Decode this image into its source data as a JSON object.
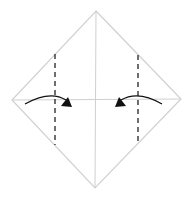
{
  "diagram": {
    "kind": "origami-fold-step",
    "colors": {
      "background": "#ffffff",
      "paper_edge": "#d0d0d0",
      "crease": "#d0d0d0",
      "valley_fold": "#222222",
      "arrow": "#111111"
    },
    "square": {
      "top": [
        96,
        11
      ],
      "right": [
        181,
        99
      ],
      "bottom": [
        95,
        188
      ],
      "left": [
        12,
        100
      ]
    },
    "creases": [
      {
        "name": "vertical-crease",
        "from": [
          96,
          11
        ],
        "to": [
          95,
          188
        ]
      },
      {
        "name": "horizontal-crease",
        "from": [
          12,
          100
        ],
        "to": [
          181,
          99
        ]
      }
    ],
    "valley_folds": [
      {
        "name": "left-valley-fold",
        "x": 55,
        "y1": 54,
        "y2": 145
      },
      {
        "name": "right-valley-fold",
        "x": 138,
        "y1": 55,
        "y2": 144
      }
    ],
    "arrows": [
      {
        "name": "left-fold-arrow",
        "direction": "right",
        "from": [
          25,
          104
        ],
        "ctrl": [
          50,
          90
        ],
        "to": [
          72,
          103
        ]
      },
      {
        "name": "right-fold-arrow",
        "direction": "left",
        "from": [
          162,
          104
        ],
        "ctrl": [
          138,
          90
        ],
        "to": [
          115,
          103
        ]
      }
    ]
  }
}
